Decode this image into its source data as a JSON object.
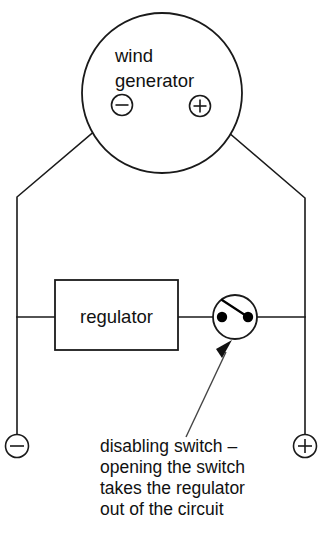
{
  "diagram": {
    "background_color": "#ffffff",
    "line_color": "#1a1a1a",
    "generator": {
      "label_line1": "wind",
      "label_line2": "generator",
      "negative_terminal_symbol": "−",
      "positive_terminal_symbol": "+"
    },
    "regulator": {
      "label": "regulator"
    },
    "switch": {
      "state": "closed-shown-open-blade"
    },
    "output_terminals": {
      "negative_symbol": "−",
      "positive_symbol": "+"
    },
    "caption": {
      "line1": "disabling switch –",
      "line2": "opening the switch",
      "line3": "takes the regulator",
      "line4": "out of the circuit"
    }
  }
}
